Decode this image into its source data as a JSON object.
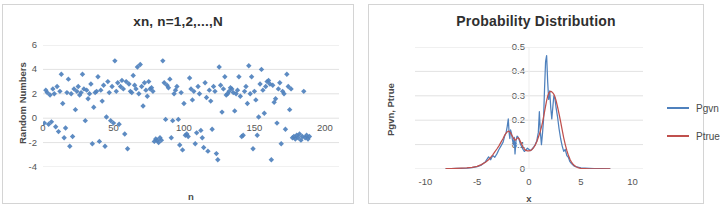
{
  "chart_data": [
    {
      "type": "scatter",
      "id": "random-numbers-scatter",
      "title": "xn, n=1,2,...,N",
      "xlabel": "n",
      "ylabel": "Random Numbers",
      "xlim": [
        0,
        210
      ],
      "ylim": [
        -4,
        6
      ],
      "xticks": [
        "0",
        "50",
        "100",
        "150",
        "200"
      ],
      "xtick_values": [
        0,
        50,
        100,
        150,
        200
      ],
      "yticks": [
        "6",
        "4",
        "2",
        "0",
        "-2",
        "-4"
      ],
      "ytick_values": [
        6,
        4,
        2,
        0,
        -2,
        -4
      ],
      "grid": "horizontal",
      "legend": "none",
      "marker": "diamond",
      "marker_color": "#4F81BD",
      "series": [
        {
          "name": "xn",
          "x": [
            1,
            2,
            3,
            4,
            5,
            6,
            7,
            8,
            9,
            10,
            11,
            12,
            13,
            14,
            15,
            16,
            17,
            18,
            19,
            20,
            21,
            22,
            23,
            24,
            25,
            26,
            27,
            28,
            29,
            30,
            31,
            32,
            33,
            34,
            35,
            36,
            37,
            38,
            39,
            40,
            41,
            42,
            43,
            44,
            45,
            46,
            47,
            48,
            49,
            50,
            51,
            52,
            53,
            54,
            55,
            56,
            57,
            58,
            59,
            60,
            61,
            62,
            63,
            64,
            65,
            66,
            67,
            68,
            69,
            70,
            71,
            72,
            73,
            74,
            75,
            76,
            77,
            78,
            79,
            80,
            81,
            82,
            83,
            84,
            85,
            86,
            87,
            88,
            89,
            90,
            91,
            92,
            93,
            94,
            95,
            96,
            97,
            98,
            99,
            100,
            101,
            102,
            103,
            104,
            105,
            106,
            107,
            108,
            109,
            110,
            111,
            112,
            113,
            114,
            115,
            116,
            117,
            118,
            119,
            120,
            121,
            122,
            123,
            124,
            125,
            126,
            127,
            128,
            129,
            130,
            131,
            132,
            133,
            134,
            135,
            136,
            137,
            138,
            139,
            140,
            141,
            142,
            143,
            144,
            145,
            146,
            147,
            148,
            149,
            150,
            151,
            152,
            153,
            154,
            155,
            156,
            157,
            158,
            159,
            160,
            161,
            162,
            163,
            164,
            165,
            166,
            167,
            168,
            169,
            170,
            171,
            172,
            173,
            174,
            175,
            176,
            177,
            178,
            179,
            180,
            181,
            182,
            183,
            184,
            185,
            186,
            187,
            188,
            189,
            190,
            191,
            192,
            193,
            194,
            195,
            196,
            197,
            198,
            199,
            200
          ],
          "y": [
            -0.4,
            2.3,
            2.1,
            -0.5,
            1.9,
            -0.3,
            2.4,
            2.0,
            -0.7,
            2.6,
            -1.1,
            2.2,
            3.6,
            1.2,
            -1.6,
            -0.8,
            2.1,
            3.2,
            -2.3,
            2.0,
            -1.5,
            2.4,
            0.7,
            2.2,
            2.6,
            1.9,
            2.1,
            3.6,
            2.4,
            -0.2,
            2.3,
            1.6,
            2.0,
            2.8,
            -2.1,
            0.9,
            2.1,
            2.2,
            3.4,
            -1.9,
            2.3,
            1.4,
            2.7,
            -2.3,
            0.1,
            3.0,
            2.1,
            -0.2,
            2.6,
            -0.4,
            4.7,
            2.2,
            2.9,
            -0.5,
            2.6,
            3.1,
            2.4,
            -1.3,
            3.0,
            -2.5,
            2.8,
            2.2,
            2.1,
            3.5,
            2.7,
            2.4,
            4.2,
            2.0,
            4.4,
            2.6,
            1.0,
            2.9,
            2.3,
            1.8,
            3.0,
            2.4,
            2.5,
            2.2,
            -1.9,
            -1.7,
            -1.8,
            -2.0,
            -1.6,
            -1.8,
            4.7,
            2.9,
            -0.1,
            2.7,
            2.5,
            3.2,
            -1.6,
            -0.2,
            2.0,
            2.3,
            2.6,
            -0.1,
            -2.2,
            2.1,
            -2.6,
            1.2,
            -1.4,
            -1.3,
            -1.5,
            3.3,
            2.4,
            1.5,
            2.2,
            -2.1,
            -1.2,
            2.6,
            2.0,
            -1.0,
            -1.6,
            -2.4,
            2.9,
            1.7,
            -2.7,
            2.3,
            1.4,
            -0.9,
            2.6,
            2.2,
            -2.9,
            -3.4,
            4.2,
            2.7,
            0.5,
            2.4,
            3.4,
            1.9,
            2.0,
            2.2,
            2.5,
            2.4,
            2.1,
            0.6,
            2.0,
            2.3,
            3.4,
            1.8,
            -1.5,
            -1.4,
            2.2,
            2.6,
            1.2,
            4.3,
            2.0,
            3.4,
            -2.5,
            2.2,
            1.5,
            -1.4,
            0.1,
            2.8,
            4.0,
            2.3,
            0.4,
            2.6,
            3.0,
            3.1,
            2.8,
            -3.4,
            2.7,
            1.3,
            1.6,
            -0.4,
            2.4,
            2.9,
            -2.1,
            2.2,
            2.0,
            -0.9,
            3.6,
            2.6,
            0.7,
            2.4,
            -1.6,
            -1.5,
            -1.7,
            -1.4,
            -1.6,
            -1.3,
            -1.8,
            -1.5,
            2.2,
            -1.6,
            -1.4,
            -1.7,
            -1.5
          ]
        }
      ]
    },
    {
      "type": "line",
      "id": "probability-distribution",
      "title": "Probability Distribution",
      "xlabel": "x",
      "ylabel": "Pgvn, Ptrue",
      "xlim": [
        -11,
        11
      ],
      "ylim": [
        0,
        0.5
      ],
      "xticks": [
        "-10",
        "-5",
        "0",
        "5",
        "10"
      ],
      "xtick_values": [
        -10,
        -5,
        0,
        5,
        10
      ],
      "yticks": [
        "0.5",
        "0.4",
        "0.3",
        "0.2",
        "0.1",
        "0"
      ],
      "ytick_values": [
        0.5,
        0.4,
        0.3,
        0.2,
        0.1,
        0
      ],
      "grid": "horizontal",
      "legend_position": "right",
      "x": [
        -8.0,
        -7.5,
        -7.0,
        -6.5,
        -6.0,
        -5.5,
        -5.0,
        -4.6,
        -4.2,
        -3.9,
        -3.7,
        -3.5,
        -3.3,
        -3.1,
        -2.9,
        -2.7,
        -2.5,
        -2.35,
        -2.2,
        -2.1,
        -2.0,
        -1.92,
        -1.85,
        -1.78,
        -1.7,
        -1.6,
        -1.5,
        -1.42,
        -1.35,
        -1.25,
        -1.15,
        -1.05,
        -0.95,
        -0.85,
        -0.75,
        -0.6,
        -0.45,
        -0.3,
        -0.15,
        0.0,
        0.15,
        0.3,
        0.45,
        0.6,
        0.75,
        0.9,
        1.0,
        1.1,
        1.2,
        1.3,
        1.4,
        1.5,
        1.6,
        1.7,
        1.8,
        1.9,
        2.0,
        2.1,
        2.2,
        2.3,
        2.4,
        2.5,
        2.6,
        2.75,
        2.9,
        3.05,
        3.2,
        3.35,
        3.5,
        3.65,
        3.8,
        3.95,
        4.1,
        4.3,
        4.5,
        4.7,
        5.0,
        5.4,
        5.8,
        6.3,
        7.0,
        7.8
      ],
      "series": [
        {
          "name": "Pgvn",
          "color": "#4F81BD",
          "values": [
            0.002,
            0.002,
            0.003,
            0.003,
            0.004,
            0.006,
            0.01,
            0.016,
            0.03,
            0.05,
            0.038,
            0.055,
            0.048,
            0.062,
            0.08,
            0.095,
            0.11,
            0.135,
            0.15,
            0.175,
            0.205,
            0.15,
            0.125,
            0.16,
            0.148,
            0.12,
            0.1,
            0.13,
            0.062,
            0.118,
            0.135,
            0.13,
            0.12,
            0.105,
            0.095,
            0.082,
            0.072,
            0.078,
            0.085,
            0.08,
            0.075,
            0.082,
            0.09,
            0.1,
            0.115,
            0.15,
            0.235,
            0.15,
            0.1,
            0.145,
            0.2,
            0.33,
            0.44,
            0.465,
            0.36,
            0.285,
            0.32,
            0.25,
            0.205,
            0.255,
            0.3,
            0.29,
            0.255,
            0.215,
            0.165,
            0.125,
            0.095,
            0.072,
            0.08,
            0.055,
            0.048,
            0.03,
            0.022,
            0.014,
            0.01,
            0.008,
            0.005,
            0.004,
            0.003,
            0.002,
            0.002,
            0.001
          ]
        },
        {
          "name": "Ptrue",
          "color": "#C0504D",
          "values": [
            0.002,
            0.002,
            0.003,
            0.004,
            0.005,
            0.007,
            0.011,
            0.018,
            0.028,
            0.038,
            0.048,
            0.058,
            0.07,
            0.082,
            0.095,
            0.11,
            0.125,
            0.138,
            0.148,
            0.152,
            0.155,
            0.154,
            0.152,
            0.148,
            0.142,
            0.134,
            0.126,
            0.122,
            0.118,
            0.12,
            0.126,
            0.128,
            0.124,
            0.115,
            0.104,
            0.092,
            0.082,
            0.076,
            0.074,
            0.074,
            0.076,
            0.08,
            0.088,
            0.098,
            0.112,
            0.13,
            0.142,
            0.156,
            0.172,
            0.19,
            0.212,
            0.235,
            0.258,
            0.28,
            0.298,
            0.31,
            0.316,
            0.318,
            0.316,
            0.312,
            0.306,
            0.296,
            0.282,
            0.256,
            0.226,
            0.194,
            0.16,
            0.128,
            0.1,
            0.076,
            0.056,
            0.04,
            0.028,
            0.017,
            0.01,
            0.006,
            0.003,
            0.002,
            0.001,
            0.001,
            0.001,
            0.001
          ]
        }
      ]
    }
  ],
  "panels": {
    "left": {
      "title": "xn, n=1,2,...,N",
      "ylabel": "Random Numbers",
      "xlabel": "n",
      "yticks": [
        "6",
        "4",
        "2",
        "0",
        "-2",
        "-4"
      ],
      "xticks": [
        "0",
        "50",
        "100",
        "150",
        "200"
      ]
    },
    "right": {
      "title": "Probability Distribution",
      "ylabel": "Pgvn, Ptrue",
      "xlabel": "x",
      "yticks": [
        "0.5",
        "0.4",
        "0.3",
        "0.2",
        "0.1",
        "0"
      ],
      "xticks": [
        "-10",
        "-5",
        "0",
        "5",
        "10"
      ],
      "legend": [
        {
          "label": "Pgvn",
          "color": "#4F81BD"
        },
        {
          "label": "Ptrue",
          "color": "#C0504D"
        }
      ]
    }
  }
}
